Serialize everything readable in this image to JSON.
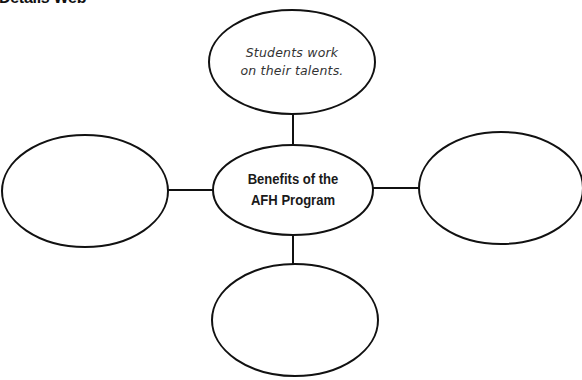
{
  "header": {
    "title": "Details Web"
  },
  "diagram": {
    "center": {
      "line1": "Benefits of the",
      "line2": "AFH Program"
    },
    "top": {
      "line1": "Students work",
      "line2": "on their talents."
    },
    "left": {
      "text": ""
    },
    "right": {
      "text": ""
    },
    "bottom": {
      "text": ""
    }
  },
  "colors": {
    "stroke": "#111111",
    "background": "#ffffff"
  }
}
